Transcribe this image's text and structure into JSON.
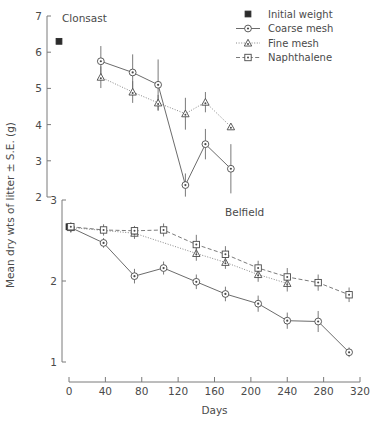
{
  "figure": {
    "y_axis_title": "Mean dry wts of litter ± S.E. (g)",
    "x_axis_title": "Days"
  },
  "legend": {
    "items": [
      {
        "key": "initial",
        "label": "Initial weight",
        "marker": "filled-square",
        "line": "none"
      },
      {
        "key": "coarse",
        "label": "Coarse mesh",
        "marker": "open-circle",
        "line": "solid"
      },
      {
        "key": "fine",
        "label": "Fine mesh",
        "marker": "open-triangle",
        "line": "dotted"
      },
      {
        "key": "naph",
        "label": "Naphthalene",
        "marker": "open-square",
        "line": "dashed"
      }
    ]
  },
  "chart_data": [
    {
      "id": "clonsast",
      "type": "line",
      "title": "Clonsast",
      "xlabel": "Days",
      "ylabel": "Mean dry wts of litter ± S.E. (g)",
      "xlim": [
        0,
        320
      ],
      "ylim": [
        2,
        7
      ],
      "yticks": [
        2,
        3,
        4,
        5,
        6,
        7
      ],
      "xticks": [
        0,
        40,
        80,
        120,
        160,
        200,
        240,
        280,
        320
      ],
      "grid": false,
      "legend_position": "top-right",
      "initial_weight": {
        "x": 0,
        "y": 6.3
      },
      "series": [
        {
          "name": "Coarse mesh",
          "marker": "open-circle",
          "line": "solid",
          "x": [
            35,
            70,
            98,
            128,
            150,
            178
          ],
          "y": [
            5.75,
            5.44,
            5.1,
            2.33,
            3.46,
            2.78
          ],
          "err": [
            0.42,
            0.5,
            0.7,
            0.32,
            0.42,
            0.68
          ]
        },
        {
          "name": "Fine mesh",
          "marker": "open-triangle",
          "line": "dotted",
          "x": [
            35,
            70,
            98,
            128,
            150,
            178
          ],
          "y": [
            5.31,
            4.9,
            4.6,
            4.3,
            4.62,
            3.94
          ],
          "err": [
            0.3,
            0.3,
            0.22,
            0.44,
            0.28,
            0.05
          ]
        }
      ]
    },
    {
      "id": "belfield",
      "type": "line",
      "title": "Belfield",
      "xlabel": "Days",
      "ylabel": "Mean dry wts of litter ± S.E. (g)",
      "xlim": [
        0,
        320
      ],
      "ylim": [
        1,
        3
      ],
      "yticks": [
        1,
        2,
        3
      ],
      "xticks": [
        0,
        40,
        80,
        120,
        160,
        200,
        240,
        280,
        320
      ],
      "grid": false,
      "initial_weight": {
        "x": 0,
        "y": 2.67
      },
      "series": [
        {
          "name": "Coarse mesh",
          "marker": "open-circle",
          "line": "solid",
          "x": [
            2,
            38,
            72,
            104,
            140,
            172,
            208,
            240,
            274,
            308
          ],
          "y": [
            2.66,
            2.47,
            2.06,
            2.16,
            1.99,
            1.84,
            1.72,
            1.51,
            1.5,
            1.12
          ],
          "err": [
            0.06,
            0.06,
            0.09,
            0.08,
            0.09,
            0.09,
            0.1,
            0.1,
            0.13,
            0.06
          ]
        },
        {
          "name": "Fine mesh",
          "marker": "open-triangle",
          "line": "dotted",
          "x": [
            2,
            72,
            140,
            172,
            208,
            240
          ],
          "y": [
            2.66,
            2.59,
            2.34,
            2.23,
            2.08,
            1.97
          ],
          "err": [
            0.06,
            0.07,
            0.09,
            0.08,
            0.09,
            0.1
          ]
        },
        {
          "name": "Naphthalene",
          "marker": "open-square",
          "line": "dashed",
          "x": [
            2,
            38,
            72,
            104,
            140,
            172,
            208,
            240,
            274,
            308
          ],
          "y": [
            2.67,
            2.63,
            2.62,
            2.63,
            2.45,
            2.33,
            2.16,
            2.05,
            1.98,
            1.83
          ],
          "err": [
            0.05,
            0.07,
            0.06,
            0.08,
            0.12,
            0.1,
            0.09,
            0.11,
            0.1,
            0.09
          ]
        }
      ]
    }
  ]
}
